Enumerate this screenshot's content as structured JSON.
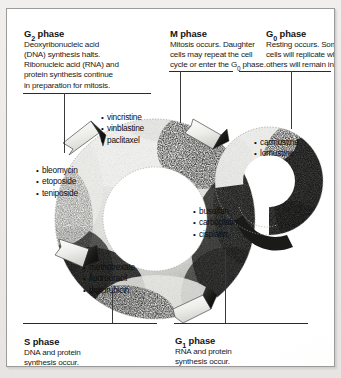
{
  "figure": {
    "type": "cell-cycle-diagram"
  },
  "phases": {
    "g2": {
      "title_main": "G",
      "title_sub": "2",
      "title_tail": " phase",
      "body_line1": "Deoxyribonucleic acid",
      "body_line2": "(DNA) synthesis halts.",
      "body_line3": "Ribonucleic acid (RNA) and",
      "body_line4": "protein synthesis continue",
      "body_line5": "in preparation for mitosis."
    },
    "m": {
      "title_main": "M phase",
      "body_line1": "Mitosis occurs. Daughter",
      "body_line2": "cells may repeat the cell",
      "body_line3a": "cycle or enter the G",
      "body_line3sub": "0",
      "body_line3b": " phase."
    },
    "g0": {
      "title_main": "G",
      "title_sub": "0",
      "title_tail": " phase",
      "body_line1": "Resting occurs. Some",
      "body_line2": "cells will replicate while",
      "body_line3": "others will remain inactive."
    },
    "s": {
      "title_main": "S phase",
      "body_line1": "DNA and protein",
      "body_line2": "synthesis occur."
    },
    "g1": {
      "title_main": "G",
      "title_sub": "1",
      "title_tail": " phase",
      "body_line1": "RNA and protein",
      "body_line2": "synthesis occur."
    }
  },
  "drugs": {
    "m_phase": [
      "vincristine",
      "vinblastine",
      "paclitaxel"
    ],
    "g2_phase": [
      "bleomycin",
      "etoposide",
      "teniposide"
    ],
    "g0_phase": [
      "carmustine",
      "lomustine"
    ],
    "s_phase": [
      "busulfan",
      "carboplatin",
      "cisplatin"
    ],
    "g1_phase": [
      "methotrexate",
      "fluorouracil",
      "doxorubicin"
    ]
  },
  "colors": {
    "ink": "#141414",
    "rule": "#2a2a2a",
    "paper": "#ffffff",
    "frame_border": "#9b9b9b",
    "page_background": "#e9e9e7",
    "ring_light": "#e8e8e6",
    "ring_dark": "#1a1a1a"
  }
}
